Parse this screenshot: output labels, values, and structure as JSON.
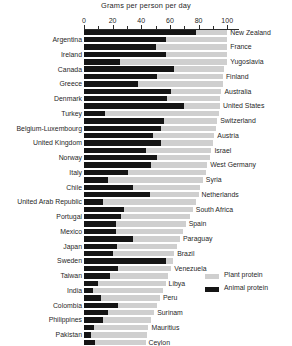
{
  "chart_data": {
    "type": "bar",
    "orientation": "horizontal",
    "stacked": true,
    "title": "Grams per person per day",
    "xlabel": "Grams per person per day",
    "ylabel": "",
    "xlim": [
      0,
      108
    ],
    "grid": false,
    "legend_position": "bottom-right",
    "axis_ticks": [
      0,
      10,
      20,
      30,
      40,
      50,
      60,
      70,
      80,
      90,
      100
    ],
    "axis_tick_labels": [
      "0",
      "20",
      "40",
      "60",
      "80",
      "100"
    ],
    "axis_labeled_ticks": [
      0,
      20,
      40,
      60,
      80,
      100
    ],
    "legend": [
      {
        "name": "Plant protein",
        "color": "#cfcfcf"
      },
      {
        "name": "Animal protein",
        "color": "#151515"
      }
    ],
    "series": [
      {
        "name": "Animal protein",
        "color": "#151515"
      },
      {
        "name": "Plant protein",
        "color": "#cfcfcf"
      }
    ],
    "categories": [
      "New Zealand",
      "Argentina",
      "France",
      "Ireland",
      "Yugoslavia",
      "Canada",
      "Finland",
      "Greece",
      "Australia",
      "Denmark",
      "United States",
      "Turkey",
      "Switzerland",
      "Belgium-Luxembourg",
      "Austria",
      "United Kingdom",
      "Israel",
      "Norway",
      "West Germany",
      "Italy",
      "Syria",
      "Chile",
      "Netherlands",
      "United Arab Republic",
      "South Africa",
      "Portugal",
      "Spain",
      "Mexico",
      "Paraguay",
      "Japan",
      "Brazil",
      "Sweden",
      "Venezuela",
      "Taiwan",
      "Libya",
      "India",
      "Peru",
      "Colombia",
      "Surinam",
      "Philippines",
      "Mauritius",
      "Pakistan",
      "Ceylon"
    ],
    "rows": [
      {
        "label": "New Zealand",
        "side": "right",
        "animal": 78,
        "plant": 22,
        "total": 100
      },
      {
        "label": "Argentina",
        "side": "left",
        "animal": 57,
        "plant": 43,
        "total": 100
      },
      {
        "label": "France",
        "side": "right",
        "animal": 50,
        "plant": 50,
        "total": 100
      },
      {
        "label": "Ireland",
        "side": "left",
        "animal": 57,
        "plant": 43,
        "total": 100
      },
      {
        "label": "Yugoslavia",
        "side": "right",
        "animal": 25,
        "plant": 75,
        "total": 100
      },
      {
        "label": "Canada",
        "side": "left",
        "animal": 63,
        "plant": 35,
        "total": 98
      },
      {
        "label": "Finland",
        "side": "right",
        "animal": 51,
        "plant": 46,
        "total": 97
      },
      {
        "label": "Greece",
        "side": "left",
        "animal": 38,
        "plant": 59,
        "total": 97
      },
      {
        "label": "Australia",
        "side": "right",
        "animal": 61,
        "plant": 35,
        "total": 96
      },
      {
        "label": "Denmark",
        "side": "left",
        "animal": 58,
        "plant": 37,
        "total": 95
      },
      {
        "label": "United States",
        "side": "right",
        "animal": 70,
        "plant": 25,
        "total": 95
      },
      {
        "label": "Turkey",
        "side": "left",
        "animal": 15,
        "plant": 79,
        "total": 94
      },
      {
        "label": "Switzerland",
        "side": "right",
        "animal": 56,
        "plant": 37,
        "total": 93
      },
      {
        "label": "Belgium-Luxembourg",
        "side": "left",
        "animal": 54,
        "plant": 38,
        "total": 92
      },
      {
        "label": "Austria",
        "side": "right",
        "animal": 48,
        "plant": 43,
        "total": 91
      },
      {
        "label": "United Kingdom",
        "side": "left",
        "animal": 54,
        "plant": 36,
        "total": 90
      },
      {
        "label": "Israel",
        "side": "right",
        "animal": 43,
        "plant": 46,
        "total": 89
      },
      {
        "label": "Norway",
        "side": "left",
        "animal": 51,
        "plant": 37,
        "total": 88
      },
      {
        "label": "West Germany",
        "side": "right",
        "animal": 47,
        "plant": 39,
        "total": 86
      },
      {
        "label": "Italy",
        "side": "left",
        "animal": 31,
        "plant": 54,
        "total": 85
      },
      {
        "label": "Syria",
        "side": "right",
        "animal": 17,
        "plant": 66,
        "total": 83
      },
      {
        "label": "Chile",
        "side": "left",
        "animal": 34,
        "plant": 47,
        "total": 81
      },
      {
        "label": "Netherlands",
        "side": "right",
        "animal": 46,
        "plant": 34,
        "total": 80
      },
      {
        "label": "United Arab Republic",
        "side": "left",
        "animal": 13,
        "plant": 65,
        "total": 78
      },
      {
        "label": "South Africa",
        "side": "right",
        "animal": 28,
        "plant": 48,
        "total": 76
      },
      {
        "label": "Portugal",
        "side": "left",
        "animal": 26,
        "plant": 48,
        "total": 74
      },
      {
        "label": "Spain",
        "side": "right",
        "animal": 22,
        "plant": 49,
        "total": 71
      },
      {
        "label": "Mexico",
        "side": "left",
        "animal": 22,
        "plant": 47,
        "total": 69
      },
      {
        "label": "Paraguay",
        "side": "right",
        "animal": 34,
        "plant": 33,
        "total": 67
      },
      {
        "label": "Japan",
        "side": "left",
        "animal": 23,
        "plant": 42,
        "total": 65
      },
      {
        "label": "Brazil",
        "side": "right",
        "animal": 20,
        "plant": 43,
        "total": 63
      },
      {
        "label": "Sweden",
        "side": "left",
        "animal": 57,
        "plant": 5,
        "total": 62
      },
      {
        "label": "Venezuela",
        "side": "right",
        "animal": 24,
        "plant": 37,
        "total": 61
      },
      {
        "label": "Taiwan",
        "side": "left",
        "animal": 18,
        "plant": 41,
        "total": 59
      },
      {
        "label": "Libya",
        "side": "right",
        "animal": 10,
        "plant": 47,
        "total": 57
      },
      {
        "label": "India",
        "side": "left",
        "animal": 6,
        "plant": 49,
        "total": 55
      },
      {
        "label": "Peru",
        "side": "right",
        "animal": 12,
        "plant": 41,
        "total": 53
      },
      {
        "label": "Colombia",
        "side": "left",
        "animal": 24,
        "plant": 27,
        "total": 51
      },
      {
        "label": "Surinam",
        "side": "right",
        "animal": 17,
        "plant": 32,
        "total": 49
      },
      {
        "label": "Philippines",
        "side": "left",
        "animal": 13,
        "plant": 34,
        "total": 47
      },
      {
        "label": "Mauritius",
        "side": "right",
        "animal": 7,
        "plant": 38,
        "total": 45
      },
      {
        "label": "Pakistan",
        "side": "left",
        "animal": 5,
        "plant": 39,
        "total": 44
      },
      {
        "label": "Ceylon",
        "side": "right",
        "animal": 8,
        "plant": 35,
        "total": 43
      }
    ]
  }
}
